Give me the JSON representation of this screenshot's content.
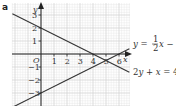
{
  "part_label": "a",
  "chart_data": {
    "type": "line",
    "title": "",
    "xlabel": "x",
    "ylabel": "y",
    "origin_label": "O",
    "xlim": [
      -2.2,
      6.8
    ],
    "ylim": [
      -4,
      4
    ],
    "x_ticks": [
      1,
      2,
      3,
      4,
      5,
      6
    ],
    "x_tick_labels": [
      "1",
      "2",
      "3",
      "4",
      "5",
      "6"
    ],
    "y_ticks": [
      -3,
      -2,
      -1,
      1,
      2,
      3
    ],
    "y_tick_labels": [
      "-3",
      "-2",
      "-1",
      "1",
      "2",
      "3"
    ],
    "grid": true,
    "series": [
      {
        "name": "2y + x = 4",
        "equation": "y = 2 - x/2",
        "slope": -0.5,
        "intercept": 2,
        "x": [
          -2.2,
          6.8
        ],
        "y": [
          3.1,
          -1.4
        ]
      },
      {
        "name": "y = ½x − 3",
        "equation": "y = x/2 - 3",
        "slope": 0.5,
        "intercept": -3,
        "x": [
          -2.2,
          6.8
        ],
        "y": [
          -4.1,
          0.4
        ]
      }
    ],
    "intersection": {
      "x": 5,
      "y": -0.5
    },
    "legend": [
      {
        "label_parts": [
          "y = ",
          "1",
          "2",
          "x − 3"
        ],
        "series": 1
      },
      {
        "label": "2y + x = 4",
        "series": 0
      }
    ]
  },
  "colors": {
    "grid_minor": "#e2e2e2",
    "grid_major": "#c8c8c8",
    "axis": "#222222",
    "line": "#333333"
  }
}
